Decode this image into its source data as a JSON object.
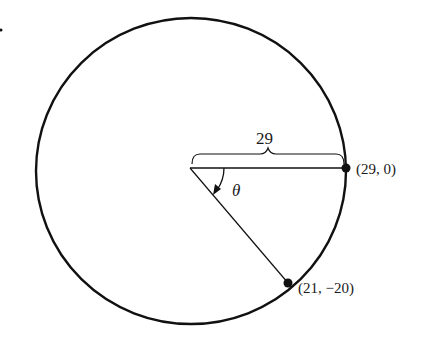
{
  "diagram": {
    "type": "circle-angle",
    "radius_label": "29",
    "angle_label": "θ",
    "points": [
      {
        "label": "(29, 0)"
      },
      {
        "label": "(21, −20)"
      }
    ],
    "colors": {
      "stroke": "#111111",
      "background": "#ffffff"
    }
  }
}
